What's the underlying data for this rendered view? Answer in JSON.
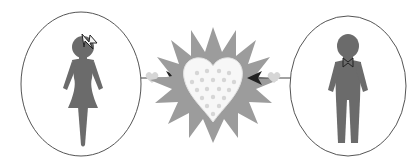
{
  "illustration": {
    "title": "Love connection",
    "left_figure": {
      "label": "woman",
      "accessory": "hair bow"
    },
    "right_figure": {
      "label": "man",
      "accessory": "bow tie"
    },
    "center": {
      "label": "burst heart",
      "pattern": "small hearts"
    },
    "connectors": {
      "left": "arrow pointing right",
      "right": "arrow pointing left"
    }
  },
  "colors": {
    "figure": "#6b6b6b",
    "burst": "#9c9c9c",
    "heart_fill": "#f7f7f7",
    "small_heart": "#d6d6d6",
    "circle_stroke": "#555555",
    "arrow": "#222222",
    "line": "#444444"
  }
}
